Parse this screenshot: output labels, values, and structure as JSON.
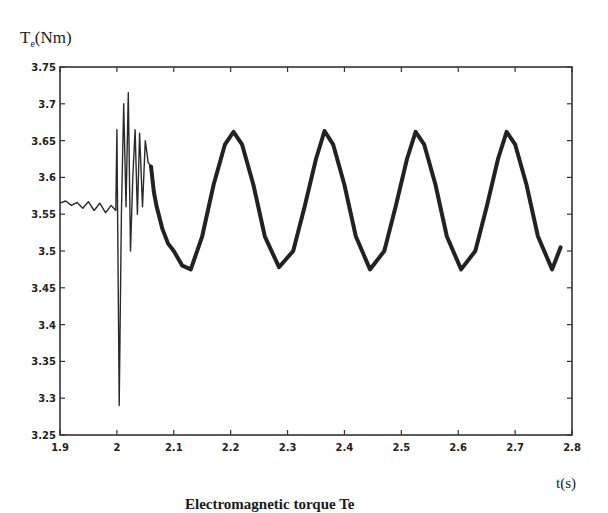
{
  "chart_data": {
    "type": "line",
    "title": "",
    "xlabel": "t(s)",
    "ylabel": "Te(Nm)",
    "ylabel_main": "T",
    "ylabel_sub": "e",
    "ylabel_unit": "(Nm)",
    "xlim": [
      1.9,
      2.8
    ],
    "ylim": [
      3.25,
      3.75
    ],
    "grid": false,
    "x_ticks": [
      "1.9",
      "2",
      "2.1",
      "2.2",
      "2.3",
      "2.4",
      "2.5",
      "2.6",
      "2.7",
      "2.8"
    ],
    "y_ticks": [
      "3.25",
      "3.3",
      "3.35",
      "3.4",
      "3.45",
      "3.5",
      "3.55",
      "3.6",
      "3.65",
      "3.7",
      "3.75"
    ],
    "series": [
      {
        "name": "Electromagnetic torque Te",
        "description": "Small ripple ~3.56 before t=2 s, large transient at t=2 s (min ~3.29, max ~3.715), then steady oscillation between ~3.475 and ~3.66 with period ~0.16 s",
        "x": [
          1.9,
          1.91,
          1.92,
          1.93,
          1.94,
          1.95,
          1.96,
          1.97,
          1.98,
          1.99,
          1.998,
          2.0,
          2.004,
          2.008,
          2.012,
          2.016,
          2.02,
          2.024,
          2.028,
          2.032,
          2.036,
          2.04,
          2.045,
          2.05,
          2.055,
          2.06,
          2.065,
          2.07,
          2.08,
          2.09,
          2.1,
          2.115,
          2.13,
          2.15,
          2.17,
          2.19,
          2.205,
          2.22,
          2.24,
          2.26,
          2.285,
          2.31,
          2.33,
          2.35,
          2.365,
          2.38,
          2.4,
          2.42,
          2.445,
          2.47,
          2.49,
          2.51,
          2.525,
          2.54,
          2.56,
          2.58,
          2.605,
          2.63,
          2.65,
          2.67,
          2.685,
          2.7,
          2.72,
          2.74,
          2.765,
          2.78
        ],
        "values": [
          3.565,
          3.568,
          3.562,
          3.566,
          3.558,
          3.567,
          3.555,
          3.565,
          3.552,
          3.562,
          3.555,
          3.665,
          3.29,
          3.55,
          3.7,
          3.56,
          3.715,
          3.5,
          3.6,
          3.665,
          3.55,
          3.66,
          3.56,
          3.65,
          3.62,
          3.615,
          3.58,
          3.56,
          3.53,
          3.51,
          3.5,
          3.48,
          3.475,
          3.52,
          3.59,
          3.645,
          3.662,
          3.645,
          3.59,
          3.52,
          3.478,
          3.5,
          3.56,
          3.625,
          3.663,
          3.645,
          3.59,
          3.52,
          3.475,
          3.5,
          3.56,
          3.625,
          3.662,
          3.645,
          3.59,
          3.52,
          3.475,
          3.5,
          3.56,
          3.625,
          3.662,
          3.645,
          3.59,
          3.52,
          3.475,
          3.505
        ]
      }
    ]
  },
  "caption": "Electromagnetic torque Te"
}
